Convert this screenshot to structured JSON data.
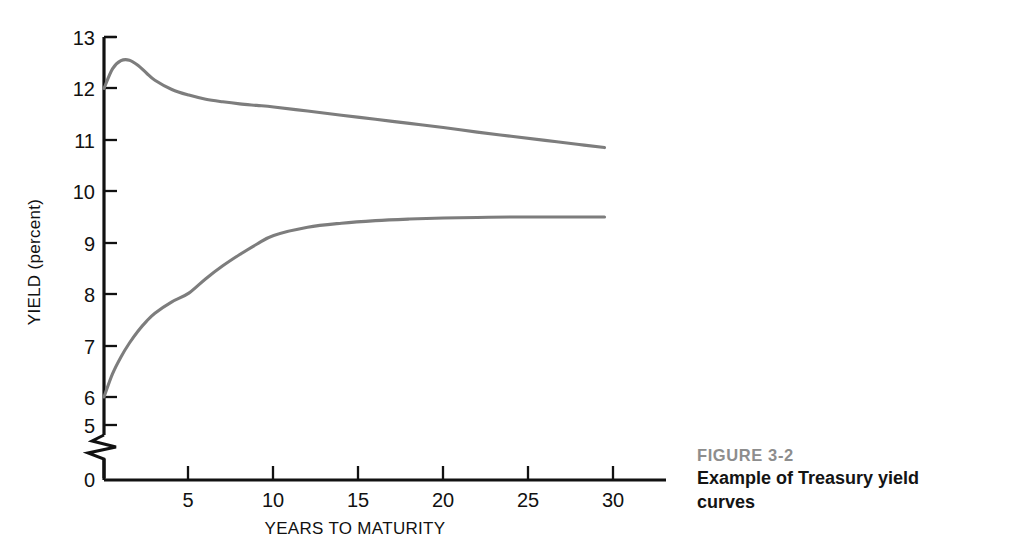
{
  "caption": {
    "figure_number": "FIGURE 3-2",
    "title": "Example of Treasury yield curves"
  },
  "chart_data": {
    "type": "line",
    "title": "Example of Treasury yield curves",
    "xlabel": "YEARS TO MATURITY",
    "ylabel": "YIELD (percent)",
    "xlim": [
      0,
      33
    ],
    "ylim": [
      5,
      13
    ],
    "y_axis_break": true,
    "y_axis_break_note": "axis broken between 0 and 5",
    "grid": false,
    "legend": "none",
    "xticks": [
      5,
      10,
      15,
      20,
      25,
      30
    ],
    "xtick_labels": [
      "5",
      "10",
      "15",
      "20",
      "25",
      "30"
    ],
    "yticks": [
      0,
      5,
      6,
      7,
      8,
      9,
      10,
      11,
      12,
      13
    ],
    "ytick_labels": [
      "0",
      "5",
      "6",
      "7",
      "8",
      "9",
      "10",
      "11",
      "12",
      "13"
    ],
    "x": [
      0,
      0.5,
      1,
      1.5,
      2,
      2.5,
      3,
      4,
      5,
      6,
      7,
      8,
      9,
      10,
      12,
      14,
      16,
      18,
      20,
      22,
      24,
      26,
      28,
      29.5
    ],
    "series": [
      {
        "name": "Inverted (downward-sloping) yield curve",
        "color": "#7d7d7d",
        "values": [
          12.0,
          12.38,
          12.54,
          12.55,
          12.45,
          12.3,
          12.16,
          11.98,
          11.87,
          11.79,
          11.74,
          11.7,
          11.67,
          11.64,
          11.56,
          11.48,
          11.4,
          11.32,
          11.24,
          11.15,
          11.07,
          10.99,
          10.91,
          10.85
        ]
      },
      {
        "name": "Normal (upward-sloping) yield curve",
        "color": "#7d7d7d",
        "values": [
          6.0,
          6.45,
          6.78,
          7.05,
          7.28,
          7.47,
          7.63,
          7.85,
          8.02,
          8.3,
          8.55,
          8.77,
          8.97,
          9.14,
          9.3,
          9.38,
          9.43,
          9.46,
          9.48,
          9.49,
          9.5,
          9.5,
          9.5,
          9.5
        ]
      }
    ],
    "annotations": []
  }
}
